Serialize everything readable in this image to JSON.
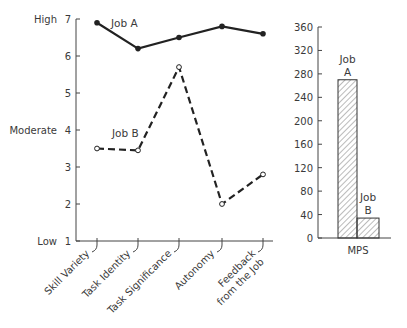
{
  "chart_data": [
    {
      "type": "line",
      "title": "",
      "xlabel": "",
      "ylabel": "",
      "ylim": [
        1,
        7
      ],
      "yticks": [
        1,
        2,
        3,
        4,
        5,
        6,
        7
      ],
      "y_qualitative_labels": [
        {
          "value": 7,
          "label": "High"
        },
        {
          "value": 4,
          "label": "Moderate"
        },
        {
          "value": 1,
          "label": "Low"
        }
      ],
      "categories": [
        "Skill Variety",
        "Task Identity",
        "Task Significance",
        "Autonomy",
        "Feedback from the Job"
      ],
      "category_lines": [
        [
          "Skill Variety"
        ],
        [
          "Task Identity"
        ],
        [
          "Task Significance"
        ],
        [
          "Autonomy"
        ],
        [
          "Feedback",
          "from the Job"
        ]
      ],
      "series": [
        {
          "name": "Job A",
          "style": "solid",
          "marker": "filled-circle",
          "values": [
            6.9,
            6.2,
            6.5,
            6.8,
            6.6
          ]
        },
        {
          "name": "Job B",
          "style": "dashed",
          "marker": "open-circle",
          "values": [
            3.5,
            3.45,
            5.7,
            2.0,
            2.8
          ]
        }
      ],
      "grid": false,
      "legend": "inline labels"
    },
    {
      "type": "bar",
      "title": "",
      "xlabel": "MPS",
      "ylabel": "",
      "ylim": [
        0,
        360
      ],
      "yticks": [
        0,
        40,
        80,
        120,
        160,
        200,
        240,
        280,
        320,
        360
      ],
      "categories": [
        "Job A",
        "Job B"
      ],
      "values": [
        270,
        34
      ],
      "fill": "diagonal hatch",
      "grid": false
    }
  ],
  "colors": {
    "ink": "#222222",
    "text": "#3a3a3a",
    "background": "#ffffff"
  }
}
